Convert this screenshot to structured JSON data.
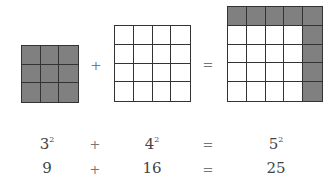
{
  "diagram": {
    "grids": [
      {
        "name": "square-3",
        "size": 3,
        "x": 21,
        "y": 45,
        "cell": 19,
        "shaded": "all",
        "shaded_color": "#808080"
      },
      {
        "name": "square-4",
        "size": 4,
        "x": 114,
        "y": 25,
        "cell": 19,
        "shaded": "none",
        "shaded_color": "#808080"
      },
      {
        "name": "square-5",
        "size": 5,
        "x": 227,
        "y": 6,
        "cell": 19,
        "shaded": "top-row-right-column",
        "shaded_color": "#808080"
      }
    ],
    "operators": {
      "plus": "+",
      "equals": "="
    }
  },
  "equations": {
    "row1": {
      "a_base": "3",
      "a_exp": "2",
      "op1": "+",
      "b_base": "4",
      "b_exp": "2",
      "op2": "=",
      "c_base": "5",
      "c_exp": "2"
    },
    "row2": {
      "a": "9",
      "op1": "+",
      "b": "16",
      "op2": "=",
      "c": "25"
    }
  }
}
